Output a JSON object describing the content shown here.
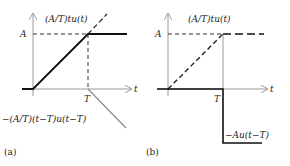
{
  "panels": [
    {
      "caption": "(a)",
      "labels": {
        "ramp": "(A/T)tu(t)",
        "neg_ramp": "−(A/T)(t−T)u(t−T)",
        "y_level": "A",
        "x_tick": "T",
        "x_axis": "t"
      }
    },
    {
      "caption": "(b)",
      "labels": {
        "ramp": "(A/T)tu(t)",
        "neg_step": "−Au(t−T)",
        "y_level": "A",
        "x_tick": "T",
        "x_axis": "t"
      }
    }
  ],
  "colors": {
    "axis": "#9a9a9a",
    "signal": "#111111",
    "component": "#8a8a8a"
  }
}
